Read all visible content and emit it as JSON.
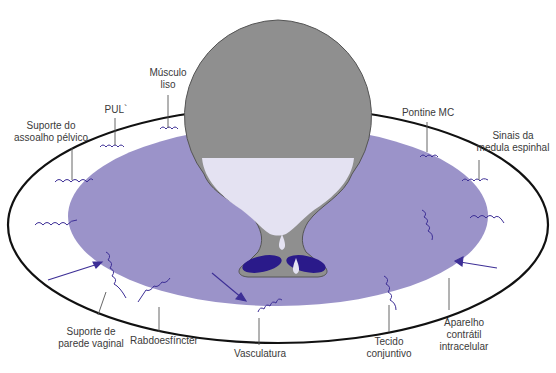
{
  "colors": {
    "pelvic_disc": "#9b93c9",
    "outer_ring_stroke": "#111111",
    "bladder_wall": "#8f8f8f",
    "urine": "#e4e2f2",
    "sphincter_dark": "#2a1a8a",
    "spring_stroke": "#3d2f96",
    "arrow": "#3d2f96",
    "leader_line": "#555555"
  },
  "labels": {
    "pelvic_floor_support": "Suporte do\nassoalho pélvico",
    "pul": "PUL`",
    "smooth_muscle": "Músculo\nliso",
    "pontine_mc": "Pontine MC",
    "spinal_signals": "Sinais da\nmedula espinhal",
    "vaginal_wall_support": "Suporte de\nparede vaginal",
    "rhabdosphincter": "Rabdoesfíncter",
    "vasculature": "Vasculatura",
    "connective_tissue": "Tecido\nconjuntivo",
    "contractile_apparatus": "Aparelho\ncontrátil\nintracelular"
  }
}
